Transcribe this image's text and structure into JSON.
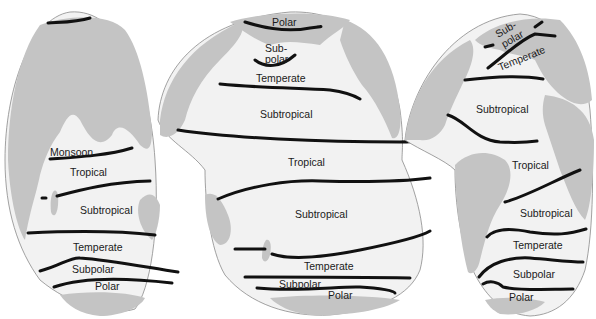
{
  "colors": {
    "ocean": "#f2f2f2",
    "land": "#c4c4c4",
    "boundary": "#111111",
    "label": "#1a1a1a"
  },
  "lobes": {
    "indian": {
      "labels": {
        "monsoon": "Monsoon",
        "tropical": "Tropical",
        "subtropical": "Subtropical",
        "temperate": "Temperate",
        "subpolar": "Subpolar",
        "polar": "Polar"
      }
    },
    "pacific": {
      "labels": {
        "polar_north": "Polar",
        "subpolar_north_1": "Sub-",
        "subpolar_north_2": "polar",
        "temperate_north": "Temperate",
        "subtropical_north": "Subtropical",
        "tropical": "Tropical",
        "subtropical_south": "Subtropical",
        "temperate_south": "Temperate",
        "subpolar_south": "Subpolar",
        "polar_south": "Polar"
      }
    },
    "atlantic": {
      "labels": {
        "subpolar_north_1": "Sub-",
        "subpolar_north_2": "polar",
        "temperate_north": "Temperate",
        "subtropical_north": "Subtropical",
        "tropical": "Tropical",
        "subtropical_south": "Subtropical",
        "temperate_south": "Temperate",
        "subpolar_south": "Subpolar",
        "polar_south": "Polar"
      }
    }
  }
}
